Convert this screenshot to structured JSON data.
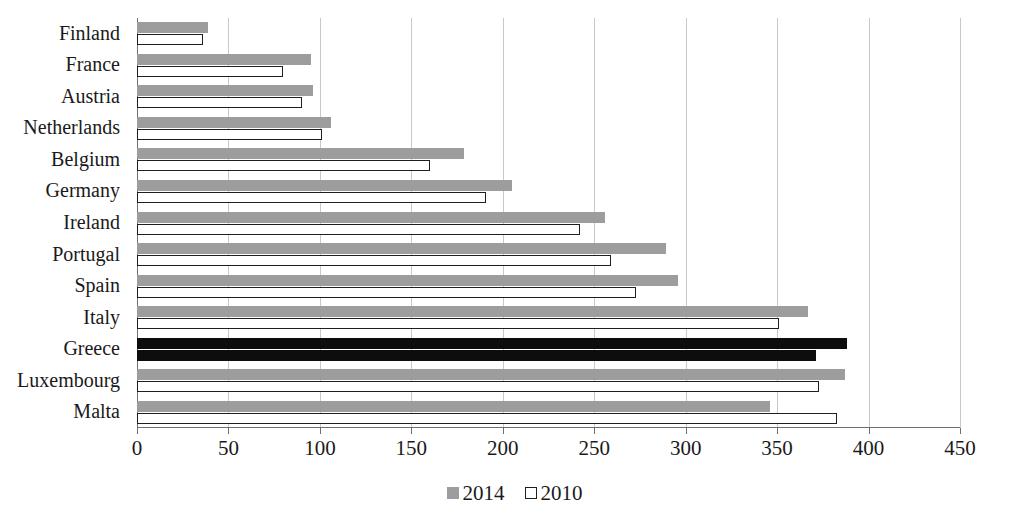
{
  "chart_data": {
    "type": "bar",
    "orientation": "horizontal",
    "title": "",
    "subtitle": "",
    "xlabel": "",
    "ylabel": "",
    "xlim": [
      0,
      450
    ],
    "ylim": null,
    "grid": true,
    "grid_axis": "x",
    "legend_position": "bottom-center",
    "categories": [
      "Finland",
      "France",
      "Austria",
      "Netherlands",
      "Belgium",
      "Germany",
      "Ireland",
      "Portugal",
      "Spain",
      "Italy",
      "Greece",
      "Luxembourg",
      "Malta"
    ],
    "xticks": [
      0,
      50,
      100,
      150,
      200,
      250,
      300,
      350,
      400,
      450
    ],
    "series": [
      {
        "name": "2014",
        "color": "#9d9d9d",
        "values": [
          39,
          95,
          96,
          106,
          179,
          205,
          256,
          289,
          296,
          367,
          388,
          387,
          346
        ]
      },
      {
        "name": "2010",
        "color": "#ffffff",
        "values": [
          36,
          80,
          90,
          101,
          160,
          191,
          242,
          259,
          273,
          351,
          371,
          373,
          383
        ]
      }
    ],
    "highlight": {
      "category": "Greece",
      "color": "#0d0d0d"
    },
    "legend": [
      {
        "label": "2014",
        "swatch": "gray"
      },
      {
        "label": "2010",
        "swatch": "white"
      }
    ]
  }
}
